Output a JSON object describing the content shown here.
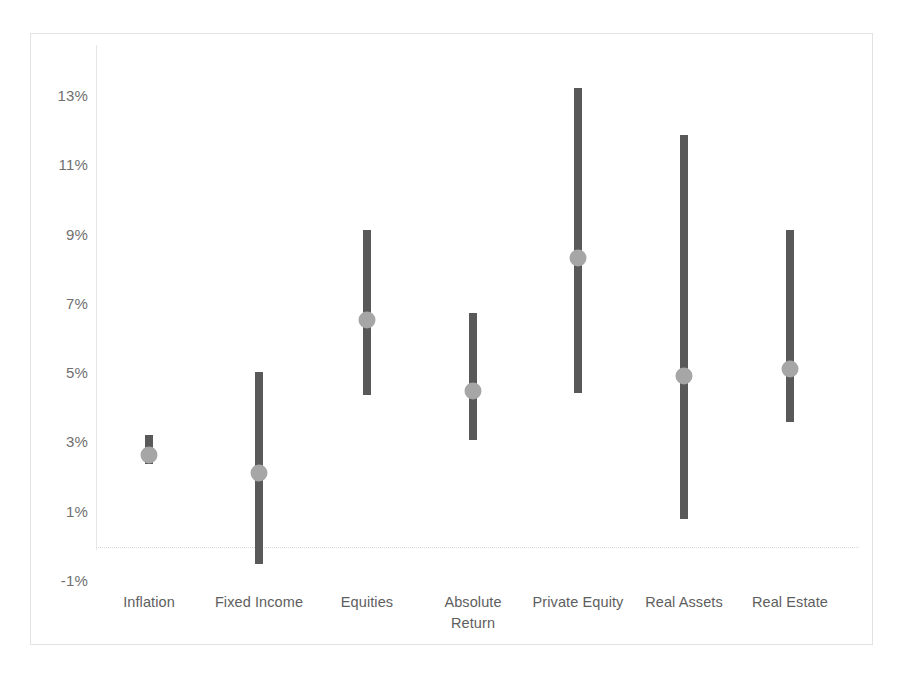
{
  "chart_data": {
    "type": "bar",
    "title": "",
    "subtitle": "",
    "xlabel": "",
    "ylabel": "",
    "ylim": [
      -1,
      13
    ],
    "grid": false,
    "legend": "none",
    "y_tick_labels": [
      "13%",
      "11%",
      "9%",
      "7%",
      "5%",
      "3%",
      "1%",
      "-1%"
    ],
    "y_tick_values": [
      13,
      11,
      9,
      7,
      5,
      3,
      1,
      -1
    ],
    "categories": [
      "Inflation",
      "Fixed Income",
      "Equities",
      "Absolute\nReturn",
      "Private Equity",
      "Real Assets",
      "Real Estate"
    ],
    "series": [
      {
        "name": "High",
        "values": [
          3.2,
          5.0,
          9.1,
          6.7,
          13.2,
          11.85,
          9.1
        ]
      },
      {
        "name": "Low",
        "values": [
          2.35,
          -0.55,
          4.35,
          3.05,
          4.4,
          0.75,
          3.55
        ]
      },
      {
        "name": "Expected",
        "values": [
          2.6,
          2.1,
          6.5,
          4.45,
          8.3,
          4.9,
          5.1
        ]
      }
    ],
    "colors": {
      "range_bar": "#595959",
      "mid_dot": "#a6a6a6",
      "axis": "#e6e6e6",
      "tick_text": "#6f6f6f",
      "frame_border": "#e2e2e2",
      "background": "#ffffff"
    }
  }
}
